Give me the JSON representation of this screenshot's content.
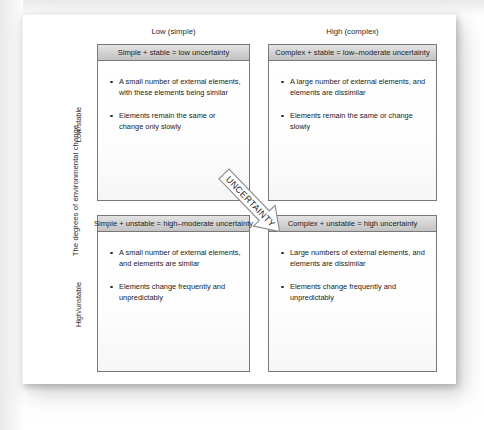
{
  "figure": {
    "y_axis": {
      "title": "The degrees of environmental change",
      "low_label": "Low/stable",
      "high_label": "High/unstable"
    },
    "columns": [
      {
        "caption": "Low (simple)"
      },
      {
        "caption": "High (complex)"
      }
    ],
    "arrow": {
      "label": "UNCERTAINTY",
      "direction": "down-right"
    },
    "quadrants": [
      {
        "id": "simple-stable",
        "header": "Simple + stable = low uncertainty",
        "bullets": [
          "A small number of external elements, with these elements being similar",
          "Elements remain the same or change only slowly"
        ]
      },
      {
        "id": "complex-stable",
        "header": "Complex + stable = low–moderate uncertainty",
        "bullets": [
          "A large number of external elements, and elements are dissimilar",
          "Elements remain the same or change slowly"
        ]
      },
      {
        "id": "simple-unstable",
        "header": "Simple + unstable = high–moderate uncertainty",
        "bullets": [
          "A small number of external elements, and elements are similar",
          "Elements change frequently and unpredictably"
        ]
      },
      {
        "id": "complex-unstable",
        "header": "Complex + unstable = high uncertainty",
        "bullets": [
          "Large numbers of external elements, and elements are dissimilar",
          "Elements change frequently and unpredictably"
        ]
      }
    ]
  },
  "colors": {
    "header_fill": "#d3d3d3",
    "border": "#787878",
    "text": "#222222",
    "page": "#ffffff"
  }
}
